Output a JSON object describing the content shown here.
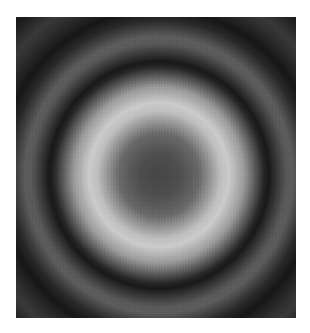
{
  "image": {
    "description": "Grayscale concentric ring interference pattern with dark center",
    "alt": "Concentric interference rings",
    "colors": {
      "background": "#ffffff",
      "dark": "#1e1e1e",
      "center": "#4a4a4a",
      "bright_ring": "#c8c8c8",
      "mid_ring": "#626262"
    }
  }
}
